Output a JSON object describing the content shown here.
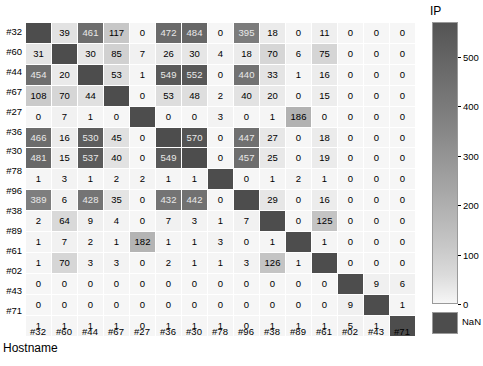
{
  "chart_data": {
    "type": "heatmap",
    "title": "",
    "xlabel": "Hostname",
    "ylabel": "",
    "colorbar_title": "IP",
    "colorbar_ticks": [
      0,
      100,
      200,
      300,
      400,
      500
    ],
    "colorbar_range": [
      0,
      570
    ],
    "nan_label": "NaN",
    "nan_color": "#4d4d4d",
    "colormap": "grayscale-inverted",
    "grid": true,
    "legend_position": "right",
    "row_labels": [
      "#32",
      "#60",
      "#44",
      "#67",
      "#27",
      "#36",
      "#30",
      "#78",
      "#96",
      "#38",
      "#89",
      "#61",
      "#02",
      "#43",
      "#71"
    ],
    "col_labels": [
      "#32",
      "#60",
      "#44",
      "#67",
      "#27",
      "#36",
      "#30",
      "#78",
      "#96",
      "#38",
      "#89",
      "#61",
      "#02",
      "#43",
      "#71"
    ],
    "values": [
      [
        null,
        39,
        461,
        117,
        0,
        472,
        484,
        0,
        395,
        18,
        0,
        11,
        0,
        0,
        0
      ],
      [
        31,
        null,
        30,
        85,
        7,
        26,
        30,
        4,
        18,
        70,
        6,
        75,
        0,
        0,
        0
      ],
      [
        454,
        20,
        null,
        53,
        1,
        549,
        552,
        0,
        440,
        33,
        1,
        16,
        0,
        0,
        0
      ],
      [
        108,
        70,
        44,
        null,
        0,
        53,
        48,
        2,
        40,
        20,
        0,
        15,
        0,
        0,
        0
      ],
      [
        0,
        7,
        1,
        0,
        null,
        0,
        0,
        3,
        0,
        1,
        186,
        0,
        0,
        0,
        0
      ],
      [
        466,
        16,
        530,
        45,
        0,
        null,
        570,
        0,
        447,
        27,
        0,
        18,
        0,
        0,
        0
      ],
      [
        481,
        15,
        537,
        40,
        0,
        549,
        null,
        0,
        457,
        25,
        0,
        19,
        0,
        0,
        0
      ],
      [
        1,
        3,
        1,
        2,
        2,
        1,
        1,
        null,
        0,
        1,
        2,
        1,
        0,
        0,
        0
      ],
      [
        389,
        6,
        428,
        35,
        0,
        432,
        442,
        0,
        null,
        29,
        0,
        16,
        0,
        0,
        0
      ],
      [
        2,
        64,
        9,
        4,
        0,
        7,
        3,
        1,
        7,
        null,
        0,
        125,
        0,
        0,
        0
      ],
      [
        1,
        7,
        2,
        1,
        182,
        1,
        1,
        3,
        0,
        1,
        null,
        1,
        0,
        0,
        0
      ],
      [
        1,
        70,
        3,
        3,
        0,
        2,
        1,
        1,
        3,
        126,
        1,
        null,
        0,
        0,
        0
      ],
      [
        0,
        0,
        0,
        0,
        0,
        0,
        0,
        0,
        0,
        0,
        0,
        0,
        null,
        9,
        6
      ],
      [
        0,
        0,
        0,
        0,
        0,
        0,
        0,
        0,
        0,
        0,
        0,
        0,
        9,
        null,
        1
      ],
      [
        1,
        1,
        1,
        1,
        0,
        1,
        1,
        1,
        0,
        1,
        1,
        1,
        5,
        1,
        null
      ]
    ]
  }
}
